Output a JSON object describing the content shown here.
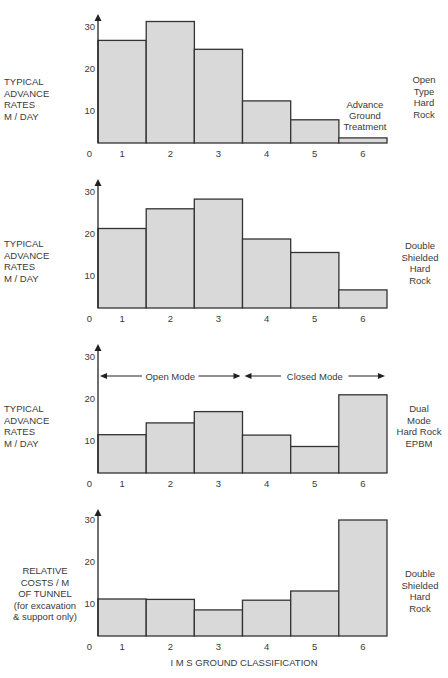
{
  "figure": {
    "xlabel": "I M S  GROUND CLASSIFICATION",
    "colors": {
      "bar_fill": "#d9d9d9",
      "bar_stroke": "#333333",
      "axis": "#222222",
      "text": "#3a3a3a"
    }
  },
  "chart_data": [
    {
      "type": "bar",
      "title": "Open Type Hard Rock",
      "ylabel": "TYPICAL ADVANCE RATES M / DAY",
      "right_label": "Open Type Hard Rock",
      "xlabel": "I M S GROUND CLASSIFICATION",
      "categories": [
        "1",
        "2",
        "3",
        "4",
        "5",
        "6"
      ],
      "values": [
        26.8,
        31.3,
        24.7,
        12.4,
        7.9,
        3.6
      ],
      "y_ticks": [
        0,
        10,
        20,
        30
      ],
      "ylim": [
        0,
        32
      ],
      "grid": false,
      "annotations": [
        {
          "text": "Advance Ground Treatment",
          "category": "6"
        }
      ]
    },
    {
      "type": "bar",
      "title": "Double Shielded Hard Rock",
      "ylabel": "TYPICAL ADVANCE RATES M / DAY",
      "right_label": "Double Shielded Hard Rock",
      "categories": [
        "1",
        "2",
        "3",
        "4",
        "5",
        "6"
      ],
      "values": [
        21.3,
        26.0,
        28.3,
        18.8,
        15.6,
        6.7
      ],
      "y_ticks": [
        0,
        10,
        20,
        30
      ],
      "ylim": [
        0,
        32
      ],
      "grid": false
    },
    {
      "type": "bar",
      "title": "Dual Mode Hard Rock EPBM",
      "ylabel": "TYPICAL ADVANCE RATES M / DAY",
      "right_label": "Dual Mode Hard Rock EPBM",
      "categories": [
        "1",
        "2",
        "3",
        "4",
        "5",
        "6"
      ],
      "values": [
        11.5,
        14.3,
        17.0,
        11.4,
        8.7,
        21.0
      ],
      "y_ticks": [
        0,
        10,
        20,
        30
      ],
      "ylim": [
        0,
        32
      ],
      "grid": false,
      "annotations": [
        {
          "text": "Open Mode",
          "span": [
            "1",
            "3"
          ],
          "type": "double-arrow"
        },
        {
          "text": "Closed Mode",
          "span": [
            "4",
            "6"
          ],
          "type": "double-arrow"
        }
      ]
    },
    {
      "type": "bar",
      "title": "Double Shielded Hard Rock",
      "ylabel": "RELATIVE COSTS / M OF TUNNEL (for excavation & support only)",
      "right_label": "Double Shielded Hard Rock",
      "categories": [
        "1",
        "2",
        "3",
        "4",
        "5",
        "6"
      ],
      "values": [
        11.2,
        11.1,
        8.6,
        10.9,
        13.1,
        30.0
      ],
      "y_ticks": [
        0,
        10,
        20,
        30
      ],
      "ylim": [
        0,
        32
      ],
      "grid": false
    }
  ],
  "panels": [
    {
      "left_label": "TYPICAL\nADVANCE\nRATES\nM / DAY",
      "right_label": "Open\nType\nHard\nRock"
    },
    {
      "left_label": "TYPICAL\nADVANCE\nRATES\nM / DAY",
      "right_label": "Double\nShielded\nHard\nRock"
    },
    {
      "left_label": "TYPICAL\nADVANCE\nRATES\nM / DAY",
      "right_label": "Dual\nMode\nHard Rock\nEPBM"
    },
    {
      "left_label": "RELATIVE\nCOSTS / M\nOF TUNNEL\n(for excavation\n& support only)",
      "right_label": "Double\nShielded\nHard\nRock"
    }
  ]
}
